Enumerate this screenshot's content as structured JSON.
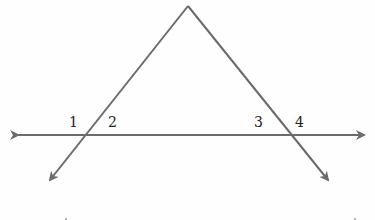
{
  "diagram": {
    "type": "geometry-transversal",
    "colors": {
      "line": "#6b6b6b",
      "label": "#222222",
      "background": "#fefefe"
    },
    "angle_labels": [
      {
        "id": "angle-1",
        "text": "1",
        "x": 69,
        "y": 115
      },
      {
        "id": "angle-2",
        "text": "2",
        "x": 108,
        "y": 115
      },
      {
        "id": "angle-3",
        "text": "3",
        "x": 254,
        "y": 115
      },
      {
        "id": "angle-4",
        "text": "4",
        "x": 295,
        "y": 115
      }
    ],
    "points": {
      "apex": [
        188,
        6
      ],
      "left_intersection": [
        83,
        135
      ],
      "right_intersection": [
        291,
        135
      ]
    }
  }
}
